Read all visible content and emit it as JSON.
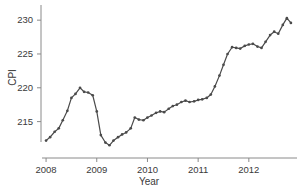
{
  "chart_data": {
    "type": "line",
    "title": "",
    "xlabel": "Year",
    "ylabel": "CPI",
    "xlim": [
      2007.9,
      2012.95
    ],
    "ylim": [
      210.8,
      231.8
    ],
    "grid": false,
    "legend": false,
    "line_color": "#4a4a4a",
    "marker": "circle",
    "xticks": [
      2008,
      2009,
      2010,
      2011,
      2012
    ],
    "xtick_labels": [
      "2008",
      "2009",
      "2010",
      "2011",
      "2012"
    ],
    "yticks": [
      215,
      220,
      225,
      230
    ],
    "ytick_labels": [
      "215",
      "220",
      "225",
      "230"
    ],
    "series_name": "CPI",
    "x": [
      2008.0,
      2008.08,
      2008.17,
      2008.25,
      2008.33,
      2008.42,
      2008.5,
      2008.58,
      2008.67,
      2008.75,
      2008.83,
      2008.92,
      2009.0,
      2009.08,
      2009.17,
      2009.25,
      2009.33,
      2009.42,
      2009.5,
      2009.58,
      2009.67,
      2009.75,
      2009.83,
      2009.92,
      2010.0,
      2010.08,
      2010.17,
      2010.25,
      2010.33,
      2010.42,
      2010.5,
      2010.58,
      2010.67,
      2010.75,
      2010.83,
      2010.92,
      2011.0,
      2011.08,
      2011.17,
      2011.25,
      2011.33,
      2011.42,
      2011.5,
      2011.58,
      2011.67,
      2011.75,
      2011.83,
      2011.92,
      2012.0,
      2012.08,
      2012.17,
      2012.25,
      2012.33,
      2012.42,
      2012.5,
      2012.58,
      2012.67,
      2012.75,
      2012.83
    ],
    "values": [
      212.2,
      212.7,
      213.5,
      214.0,
      215.2,
      216.6,
      218.5,
      219.1,
      220.0,
      219.4,
      219.3,
      218.9,
      216.5,
      213.0,
      211.9,
      211.5,
      212.2,
      212.7,
      213.1,
      213.4,
      214.0,
      215.6,
      215.3,
      215.2,
      215.6,
      215.9,
      216.3,
      216.5,
      216.4,
      216.9,
      217.3,
      217.5,
      217.9,
      218.1,
      217.9,
      218.0,
      218.2,
      218.3,
      218.5,
      219.0,
      220.2,
      221.8,
      223.4,
      225.0,
      226.0,
      225.9,
      225.8,
      226.2,
      226.4,
      226.5,
      226.1,
      225.9,
      226.8,
      227.8,
      228.3,
      228.0,
      229.3,
      230.3,
      229.6
    ]
  }
}
